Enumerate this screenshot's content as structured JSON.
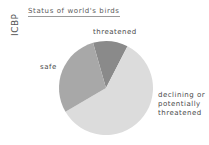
{
  "source_label": "ICBP",
  "chart_data": {
    "type": "pie",
    "title": "Status of world's birds",
    "categories": [
      "threatened",
      "declining or potentially threatened",
      "safe"
    ],
    "values": [
      12,
      59,
      29
    ],
    "unit": "%",
    "start_angle_deg": -16,
    "colors": [
      "#8a8a8a",
      "#dcdcdc",
      "#a8a8a8"
    ],
    "labels": [
      {
        "text": "threatened",
        "position": "top"
      },
      {
        "text": "declining or potentially threatened",
        "lines": [
          "declining or",
          "potentially",
          "threatened"
        ],
        "position": "right"
      },
      {
        "text": "safe",
        "position": "left"
      }
    ],
    "legend": "none (direct labels)",
    "xlabel": "",
    "ylabel": ""
  }
}
